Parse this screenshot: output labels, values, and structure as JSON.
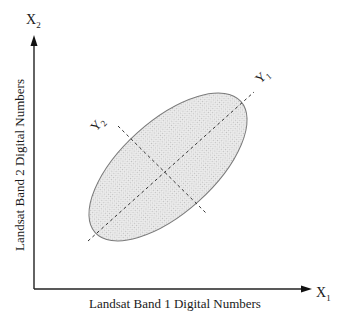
{
  "diagram": {
    "type": "principal-components-scatter-ellipse",
    "x_axis": {
      "label": "Landsat Band 1 Digital Numbers",
      "symbol": "X",
      "subscript": "1"
    },
    "y_axis": {
      "label": "Landsat Band 2 Digital Numbers",
      "symbol": "X",
      "subscript": "2"
    },
    "principal_axes": [
      {
        "symbol": "Y",
        "subscript": "1",
        "description": "first principal component (major axis)"
      },
      {
        "symbol": "Y",
        "subscript": "2",
        "description": "second principal component (minor axis)"
      }
    ],
    "ellipse": {
      "fill": "#e6e6e6",
      "stroke": "#7a7a7a",
      "rotation_deg": -42
    },
    "colors": {
      "axis": "#222222",
      "dashed": "#333333",
      "ellipse_fill": "#e6e6e6",
      "ellipse_stroke": "#7a7a7a"
    }
  }
}
